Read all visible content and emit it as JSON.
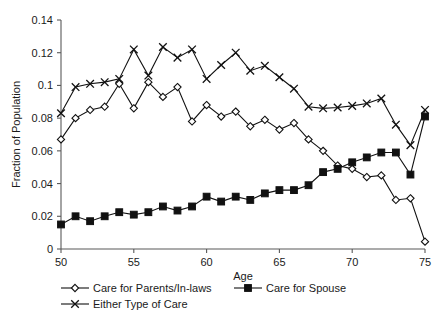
{
  "chart_data": {
    "type": "line",
    "title": "",
    "xlabel": "Age",
    "ylabel": "Fraction of Population",
    "xlim": [
      50,
      75
    ],
    "ylim": [
      0,
      0.14
    ],
    "xticks": [
      50,
      55,
      60,
      65,
      70,
      75
    ],
    "xtick_labels": [
      "50",
      "55",
      "60",
      "65",
      "70",
      "75"
    ],
    "yticks": [
      0,
      0.02,
      0.04,
      0.06,
      0.08,
      0.1,
      0.12,
      0.14
    ],
    "ytick_labels": [
      "0",
      "0.02",
      "0.04",
      "0.06",
      "0.08",
      "0.1",
      "0.12",
      "0.14"
    ],
    "grid": false,
    "legend_position": "bottom",
    "x": [
      50,
      51,
      52,
      53,
      54,
      55,
      56,
      57,
      58,
      59,
      60,
      61,
      62,
      63,
      64,
      65,
      66,
      67,
      68,
      69,
      70,
      71,
      72,
      73,
      74,
      75
    ],
    "series": [
      {
        "name": "Care for Parents/In-laws",
        "marker": "diamond-open",
        "values": [
          0.067,
          0.08,
          0.085,
          0.087,
          0.101,
          0.086,
          0.102,
          0.093,
          0.099,
          0.078,
          0.088,
          0.081,
          0.084,
          0.075,
          0.079,
          0.073,
          0.077,
          0.067,
          0.06,
          0.051,
          0.049,
          0.044,
          0.045,
          0.03,
          0.031,
          0.0045
        ]
      },
      {
        "name": "Care for Spouse",
        "marker": "square-solid",
        "values": [
          0.015,
          0.02,
          0.017,
          0.02,
          0.0225,
          0.021,
          0.0225,
          0.026,
          0.0235,
          0.026,
          0.032,
          0.029,
          0.032,
          0.03,
          0.034,
          0.036,
          0.036,
          0.039,
          0.047,
          0.049,
          0.053,
          0.056,
          0.059,
          0.059,
          0.0455,
          0.081
        ]
      },
      {
        "name": "Either Type of Care",
        "marker": "cross",
        "values": [
          0.083,
          0.099,
          0.101,
          0.102,
          0.104,
          0.122,
          0.106,
          0.1235,
          0.117,
          0.122,
          0.104,
          0.1125,
          0.12,
          0.109,
          0.112,
          0.105,
          0.098,
          0.087,
          0.086,
          0.0865,
          0.0875,
          0.089,
          0.092,
          0.076,
          0.0635,
          0.085
        ]
      }
    ]
  },
  "legend": {
    "items": [
      {
        "label": "Care for Parents/In-laws",
        "marker": "diamond-open"
      },
      {
        "label": "Care for Spouse",
        "marker": "square-solid"
      },
      {
        "label": "Either Type of Care",
        "marker": "cross"
      }
    ]
  }
}
